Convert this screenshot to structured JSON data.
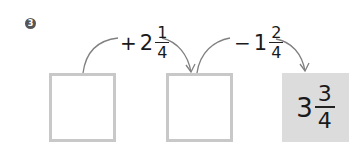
{
  "problem": {
    "number_badge": "3",
    "steps": [
      {
        "sign": "+",
        "whole": "2",
        "numerator": "1",
        "denominator": "4"
      },
      {
        "sign": "−",
        "whole": "1",
        "numerator": "2",
        "denominator": "4"
      }
    ],
    "boxes": [
      {
        "value": ""
      },
      {
        "value": ""
      },
      {
        "whole": "3",
        "numerator": "3",
        "denominator": "4"
      }
    ],
    "colors": {
      "box_border": "#c8c8c8",
      "filled_box": "#dcdcdc",
      "arrow": "#808080"
    }
  }
}
